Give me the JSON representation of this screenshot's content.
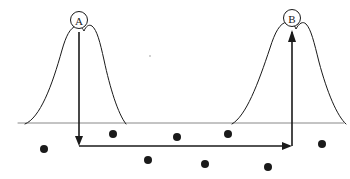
{
  "figure": {
    "type": "annotated-spectrum-diagram",
    "width": 350,
    "height": 179,
    "background_color": "#ffffff",
    "ink_color": "#1a1a1a",
    "baseline_color": "#555555",
    "style": "hand-drawn line art, scanned grayscale"
  },
  "baseline": {
    "label": "horizontal-axis-line",
    "x1": 18,
    "x2": 344,
    "y": 123,
    "stroke_width": 0.8,
    "color": "#6b6b6b"
  },
  "peaks": [
    {
      "id": "peak-a",
      "label": "A",
      "label_shape": "circle",
      "apex_x": 78,
      "apex_y": 27,
      "base_left_x": 25,
      "base_right_x": 126,
      "baseline_y": 123,
      "path": "M 25 124 C 40 118 52 86 62 50 C 66 36 70 28 76 26 C 79 25 82 27 84 31 C 86 26 89 24 92 26 C 97 30 100 42 104 60 C 110 88 118 114 126 124",
      "note": "left bell-shaped peak with small dip at apex"
    },
    {
      "id": "peak-b",
      "label": "B",
      "label_shape": "circle",
      "apex_x": 292,
      "apex_y": 23,
      "base_left_x": 232,
      "base_right_x": 346,
      "baseline_y": 123,
      "path": "M 232 124 C 246 116 258 84 270 48 C 275 32 280 23 287 22 C 291 21 294 24 296 29 C 299 23 303 21 306 24 C 311 29 314 42 319 62 C 327 92 337 116 346 124",
      "note": "right bell-shaped peak with small dip at apex"
    }
  ],
  "circle_labels": [
    {
      "id": "circle-label-a",
      "text": "A",
      "cx": 79,
      "cy": 20,
      "r": 8.5,
      "stroke_width": 1.0
    },
    {
      "id": "circle-label-b",
      "text": "B",
      "cx": 292,
      "cy": 18,
      "r": 8.5,
      "stroke_width": 1.0
    }
  ],
  "arrow_path": {
    "id": "transfer-arrow",
    "description": "arrow descending from peak A, running right along the bottom, then ascending to peak B",
    "stroke_width": 1.6,
    "color": "#1a1a1a",
    "segments": [
      {
        "name": "descending-segment-from-a",
        "x1": 79,
        "y1": 32,
        "x2": 79,
        "y2": 142,
        "direction": "down",
        "arrowhead": "end"
      },
      {
        "name": "horizontal-segment",
        "x1": 79,
        "y1": 146,
        "x2": 289,
        "y2": 146,
        "direction": "right",
        "arrowhead": "end"
      },
      {
        "name": "ascending-segment-to-b",
        "x1": 292,
        "y1": 146,
        "x2": 292,
        "y2": 32,
        "direction": "up",
        "arrowhead": "end"
      }
    ],
    "arrowheads": [
      {
        "name": "arrowhead-down-at-a",
        "x": 79,
        "y": 145,
        "points": "75,136 83,136 79,146"
      },
      {
        "name": "arrowhead-right-at-corner",
        "x": 290,
        "y": 146,
        "points": "282,142 282,150 292,146"
      },
      {
        "name": "arrowhead-up-at-b",
        "x": 292,
        "y": 31,
        "points": "288,42 296,42 292,30"
      }
    ]
  },
  "dots": {
    "label": "scatter-dots",
    "radius": 4.0,
    "color": "#1a1a1a",
    "points": [
      {
        "id": "dot-1",
        "cx": 44,
        "cy": 149
      },
      {
        "id": "dot-2",
        "cx": 113,
        "cy": 134
      },
      {
        "id": "dot-3",
        "cx": 148,
        "cy": 160
      },
      {
        "id": "dot-4",
        "cx": 177,
        "cy": 137
      },
      {
        "id": "dot-5",
        "cx": 205,
        "cy": 164
      },
      {
        "id": "dot-6",
        "cx": 228,
        "cy": 134
      },
      {
        "id": "dot-7",
        "cx": 268,
        "cy": 167
      },
      {
        "id": "dot-8",
        "cx": 322,
        "cy": 144
      }
    ]
  },
  "speck": {
    "label": "stray-scan-speck",
    "cx": 150,
    "cy": 56,
    "r": 0.9,
    "color": "#bdbdbd"
  }
}
